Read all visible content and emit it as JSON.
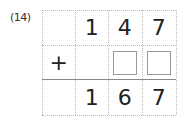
{
  "problem": {
    "label": "(14)",
    "row1": [
      "",
      "1",
      "4",
      "7"
    ],
    "row2": {
      "operator": "+",
      "blank_count": 2
    },
    "row3": [
      "",
      "1",
      "6",
      "7"
    ]
  }
}
